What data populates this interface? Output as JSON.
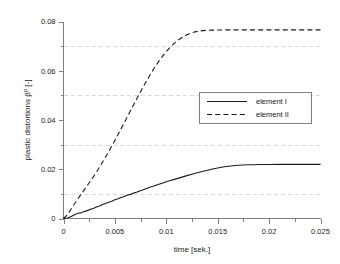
{
  "chart_data": {
    "type": "line",
    "title": "",
    "xlabel": "time [sek.]",
    "ylabel": "plastic distortions βᵖ [-]",
    "ylabel_base": "plastic distortions β",
    "ylabel_sup": "p",
    "ylabel_tail": " [-]",
    "xlim": [
      0,
      0.025
    ],
    "ylim": [
      0,
      0.08
    ],
    "grid": true,
    "grid_axis": "y",
    "grid_style": "dashed",
    "grid_values": [
      0.01,
      0.03,
      0.05,
      0.07
    ],
    "legend_position": "center-right",
    "xticks": [
      0,
      0.005,
      0.01,
      0.015,
      0.02,
      0.025
    ],
    "xticklabels": [
      "0",
      "0.005",
      "0.01",
      "0.015",
      "0.02",
      "0.025"
    ],
    "xminorticks": [
      0.0025,
      0.0075,
      0.0125,
      0.0175,
      0.0225
    ],
    "yticks": [
      0,
      0.02,
      0.04,
      0.06,
      0.08
    ],
    "yticklabels": [
      "0",
      "0.02",
      "0.04",
      "0.06",
      "0.08"
    ],
    "yminorticks": [
      0.01,
      0.03,
      0.05,
      0.07
    ],
    "series": [
      {
        "name": "element  I",
        "style": "solid",
        "color": "#1a1a1a",
        "x": [
          0.0,
          0.0004,
          0.0008,
          0.0011,
          0.0014,
          0.0017,
          0.002,
          0.0023,
          0.0026,
          0.0029,
          0.0032,
          0.0035,
          0.0038,
          0.0041,
          0.0044,
          0.0047,
          0.005,
          0.0053,
          0.0056,
          0.0059,
          0.0062,
          0.0065,
          0.0068,
          0.0071,
          0.0074,
          0.0077,
          0.008,
          0.0084,
          0.0088,
          0.0092,
          0.0096,
          0.01,
          0.0104,
          0.0108,
          0.0112,
          0.0116,
          0.012,
          0.0125,
          0.013,
          0.0135,
          0.014,
          0.0145,
          0.015,
          0.0155,
          0.016,
          0.0165,
          0.017,
          0.0175,
          0.018,
          0.0185,
          0.019,
          0.0195,
          0.02,
          0.021,
          0.022,
          0.023,
          0.024,
          0.025
        ],
        "y": [
          0.0,
          0.0002,
          0.0009,
          0.0016,
          0.0021,
          0.0023,
          0.0028,
          0.0032,
          0.0037,
          0.0041,
          0.0047,
          0.0051,
          0.0057,
          0.0061,
          0.0066,
          0.007,
          0.0076,
          0.008,
          0.0085,
          0.0089,
          0.0094,
          0.0098,
          0.0103,
          0.0107,
          0.0112,
          0.0116,
          0.0121,
          0.0127,
          0.0132,
          0.0138,
          0.0143,
          0.0149,
          0.0154,
          0.0159,
          0.0164,
          0.0169,
          0.0174,
          0.018,
          0.0186,
          0.0191,
          0.0196,
          0.0201,
          0.0205,
          0.0209,
          0.0212,
          0.0214,
          0.0216,
          0.0217,
          0.0218,
          0.02185,
          0.0219,
          0.02192,
          0.02195,
          0.02197,
          0.02198,
          0.02199,
          0.022,
          0.022
        ]
      },
      {
        "name": "element  II",
        "style": "dashed",
        "color": "#1a1a1a",
        "x": [
          0.0,
          0.0004,
          0.0008,
          0.0012,
          0.0016,
          0.002,
          0.0024,
          0.0028,
          0.0032,
          0.0036,
          0.004,
          0.0044,
          0.0048,
          0.0052,
          0.0056,
          0.006,
          0.0064,
          0.0068,
          0.0072,
          0.0076,
          0.008,
          0.0084,
          0.0088,
          0.0092,
          0.0096,
          0.01,
          0.0104,
          0.0108,
          0.0112,
          0.0116,
          0.012,
          0.0124,
          0.0128,
          0.0132,
          0.0136,
          0.014,
          0.0145,
          0.015,
          0.016,
          0.017,
          0.018,
          0.019,
          0.02,
          0.021,
          0.022,
          0.023,
          0.024,
          0.025
        ],
        "y": [
          0.0,
          0.0016,
          0.0043,
          0.0068,
          0.0092,
          0.0115,
          0.0139,
          0.0163,
          0.0188,
          0.0215,
          0.0243,
          0.0272,
          0.0302,
          0.0333,
          0.0364,
          0.0396,
          0.0428,
          0.046,
          0.0492,
          0.0523,
          0.0553,
          0.0582,
          0.0609,
          0.0634,
          0.0657,
          0.0678,
          0.0696,
          0.0712,
          0.0726,
          0.0737,
          0.0746,
          0.0753,
          0.0758,
          0.0761,
          0.0763,
          0.07645,
          0.0765,
          0.07655,
          0.0766,
          0.0766,
          0.0766,
          0.0766,
          0.0766,
          0.0766,
          0.0766,
          0.0766,
          0.0766,
          0.0766
        ]
      }
    ],
    "legend": [
      {
        "label": "element  I",
        "style": "solid"
      },
      {
        "label": "element  II",
        "style": "dashed"
      }
    ]
  }
}
